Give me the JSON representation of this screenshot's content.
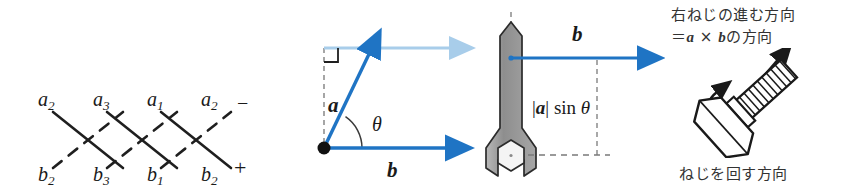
{
  "figure": {
    "kind": "vector-cross-product-figure",
    "background": "#ffffff",
    "accent_blue": "#1f74c4",
    "light_blue": "#a8cdea",
    "ink": "#1a1a1a",
    "metal_gray": "#9a9a9a"
  },
  "panel_mnemonic": {
    "name": "cross-product-index-mnemonic",
    "top_labels": [
      {
        "base": "a",
        "sub": "2"
      },
      {
        "base": "a",
        "sub": "3"
      },
      {
        "base": "a",
        "sub": "1"
      },
      {
        "base": "a",
        "sub": "2"
      }
    ],
    "bottom_labels": [
      {
        "base": "b",
        "sub": "2"
      },
      {
        "base": "b",
        "sub": "3"
      },
      {
        "base": "b",
        "sub": "1"
      },
      {
        "base": "b",
        "sub": "2"
      }
    ],
    "minus_sign": "−",
    "plus_sign": "+",
    "solid_line_meaning": "negative-products",
    "dashed_line_meaning": "positive-products"
  },
  "panel_vectors": {
    "name": "vector-angle-panel",
    "vector_a_label": "a",
    "vector_b_label": "b",
    "angle_label": "θ",
    "right_angle_marker": true,
    "origin_dot": true
  },
  "panel_wrench": {
    "name": "wrench-torque-panel",
    "vector_b_label": "b",
    "height_label": "|a| sin θ",
    "height_label_parts": {
      "bar": "|",
      "vec": "a",
      "bar2": "|",
      "trig": "sin",
      "angle": "θ"
    },
    "object": "open-end-wrench-on-hex-nut"
  },
  "panel_screw": {
    "name": "right-hand-screw-panel",
    "caption_top_line1": "右ねじの進む方向",
    "caption_top_line2_prefix": "＝",
    "caption_top_line2_a": "a",
    "caption_top_line2_times": "×",
    "caption_top_line2_b": "b",
    "caption_top_line2_suffix": "の方向",
    "caption_bottom": "ねじを回す方向",
    "object": "hex-head-bolt-with-threads",
    "advance_arrow": "straight-arrow-up-right",
    "rotation_arrow": "curved-arrow-counterclockwise"
  }
}
